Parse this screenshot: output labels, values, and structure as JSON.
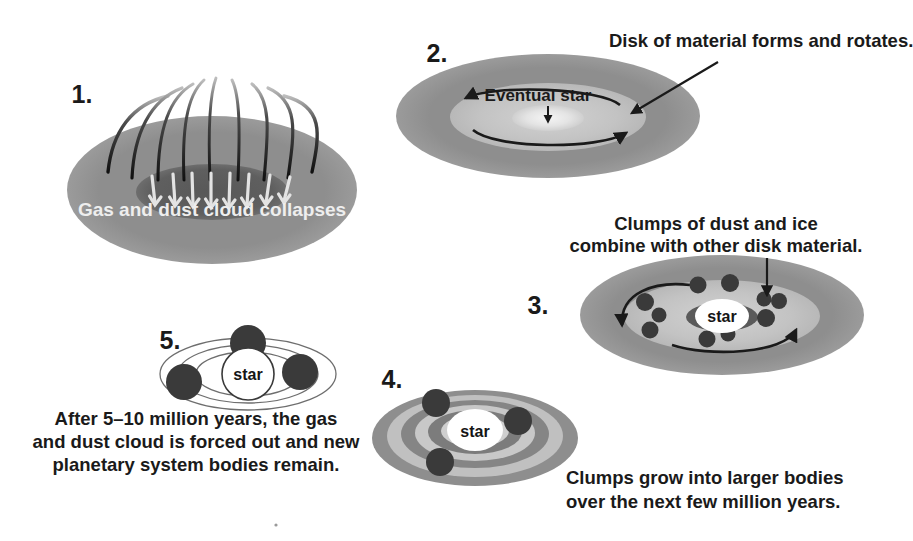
{
  "diagram": {
    "background_color": "#ffffff",
    "width": 913,
    "height": 541,
    "palette": {
      "cloud_outer": "#8e8e8e",
      "cloud_inner": "#5f5f5f",
      "disk_mid": "#c3c3c3",
      "disk_core": "#e8e8e8",
      "ring_light": "#bdbdbd",
      "ring_dark": "#787878",
      "clump": "#3a3a3a",
      "ink": "#1a1a1a",
      "light_text": "#eeeeee",
      "star_fill": "#ffffff"
    }
  },
  "stages": [
    {
      "id": "stage-1",
      "number": "1.",
      "number_pos": {
        "x": 82,
        "y": 103
      },
      "inner_label": "Gas and dust cloud collapses",
      "inner_label_pos": {
        "x": 212,
        "y": 216
      },
      "cloud": {
        "cx": 212,
        "cy": 190,
        "rx": 145,
        "ry": 74
      },
      "core": {
        "cx": 212,
        "cy": 192,
        "rx": 76,
        "ry": 28
      },
      "streamers": 9,
      "arrows": 8
    },
    {
      "id": "stage-2",
      "number": "2.",
      "number_pos": {
        "x": 437,
        "y": 62
      },
      "callout": "Disk of material forms and rotates.",
      "callout_pos": {
        "x": 609,
        "y": 47
      },
      "inner_label": "Eventual star",
      "inner_label_pos": {
        "x": 538,
        "y": 101
      },
      "cloud": {
        "cx": 548,
        "cy": 116,
        "rx": 152,
        "ry": 62
      },
      "disk": {
        "cx": 548,
        "cy": 117,
        "rx": 98,
        "ry": 34
      },
      "core": {
        "cx": 548,
        "cy": 118,
        "rx": 36,
        "ry": 13
      },
      "rotation_arrows": 2
    },
    {
      "id": "stage-3",
      "number": "3.",
      "number_pos": {
        "x": 538,
        "y": 314
      },
      "caption_lines": [
        "Clumps of dust and ice",
        "combine with other disk material."
      ],
      "caption_pos": {
        "x": 716,
        "y": 230
      },
      "star_label": "star",
      "cloud": {
        "cx": 722,
        "cy": 315,
        "rx": 142,
        "ry": 60
      },
      "disk": {
        "cx": 722,
        "cy": 316,
        "rx": 98,
        "ry": 36
      },
      "core": {
        "cx": 722,
        "cy": 317,
        "rx": 36,
        "ry": 14
      },
      "star": {
        "cx": 722,
        "cy": 316,
        "rx": 26,
        "ry": 16
      },
      "clump_count": 11,
      "rotation_arrows": 2
    },
    {
      "id": "stage-4",
      "number": "4.",
      "number_pos": {
        "x": 392,
        "y": 388
      },
      "caption_lines": [
        "Clumps grow into larger bodies",
        "over the next few million years."
      ],
      "caption_pos": {
        "x": 566,
        "y": 484
      },
      "star_label": "star",
      "cloud": {
        "cx": 475,
        "cy": 438,
        "rx": 103,
        "ry": 48
      },
      "ring_count": 6,
      "star": {
        "cx": 475,
        "cy": 430,
        "rx": 28,
        "ry": 20
      },
      "planet_count": 3
    },
    {
      "id": "stage-5",
      "number": "5.",
      "number_pos": {
        "x": 170,
        "y": 349
      },
      "caption_lines": [
        "After 5–10 million years, the gas",
        "and dust cloud is forced out and new",
        "planetary system bodies remain."
      ],
      "caption_pos": {
        "x": 196,
        "y": 418
      },
      "star_label": "star",
      "star": {
        "cx": 248,
        "cy": 374,
        "r": 26
      },
      "orbit_count": 3,
      "planet_count": 3
    }
  ],
  "artifact": {
    "name": "scan-speck",
    "x": 276,
    "y": 525,
    "r": 1.6
  }
}
